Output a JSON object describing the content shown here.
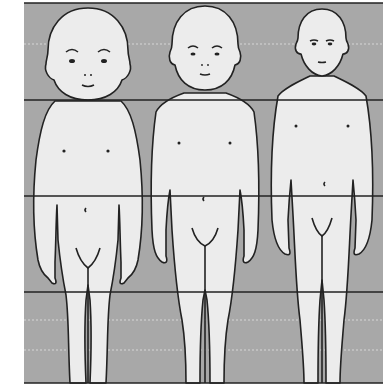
{
  "figure": {
    "description": "Proportion comparison of three child figures at increasing ages against a four-band grid",
    "background_color": "#a8a8a8",
    "figure_fill": "#ececec",
    "outline_color": "#222222",
    "grid_lines_y": [
      3,
      100,
      196,
      292,
      383
    ],
    "figures": [
      {
        "label": "figure-1-youngest"
      },
      {
        "label": "figure-2-middle"
      },
      {
        "label": "figure-3-oldest"
      }
    ]
  }
}
